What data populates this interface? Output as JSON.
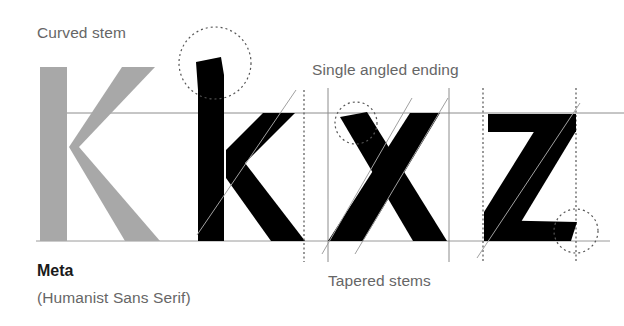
{
  "annotations": {
    "curved_stem": "Curved stem",
    "single_angled_ending": "Single angled ending",
    "tapered_stems": "Tapered stems"
  },
  "typeface": {
    "name": "Meta",
    "classification": "(Humanist Sans Serif)"
  },
  "glyphs": [
    {
      "char": "K",
      "style": "gray-reference"
    },
    {
      "char": "k",
      "style": "black"
    },
    {
      "char": "x",
      "style": "black"
    },
    {
      "char": "z",
      "style": "black"
    }
  ],
  "colors": {
    "glyph_black": "#000000",
    "glyph_gray": "#a8a8a8",
    "guide_line": "#9a9a9a",
    "dashed_marker": "#555555",
    "label_text": "#666666"
  }
}
